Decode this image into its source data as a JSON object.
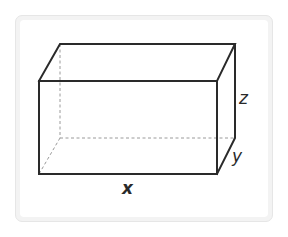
{
  "diagram": {
    "type": "rectangular-prism",
    "labels": {
      "length": "x",
      "depth": "y",
      "height": "z"
    },
    "colors": {
      "edge": "#2a2a2a",
      "hidden_edge": "#9a9a9a",
      "card_background": "#f3f3f3",
      "card_border": "#e6e6e6"
    },
    "vertices": {
      "front_top_left": [
        39,
        81
      ],
      "front_top_right": [
        217,
        81
      ],
      "front_bottom_left": [
        39,
        174
      ],
      "front_bottom_right": [
        217,
        174
      ],
      "back_top_left": [
        60,
        44
      ],
      "back_top_right": [
        235,
        44
      ],
      "back_bottom_left": [
        60,
        138
      ],
      "back_bottom_right": [
        235,
        138
      ]
    }
  }
}
